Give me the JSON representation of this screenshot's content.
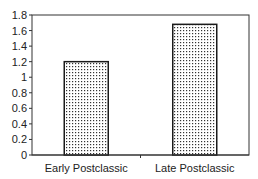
{
  "chart_data": {
    "type": "bar",
    "title": "",
    "xlabel": "",
    "ylabel": "",
    "categories": [
      "Early Postclassic",
      "Late Postclassic"
    ],
    "values": [
      1.2,
      1.68
    ],
    "ylim": [
      0,
      1.8
    ],
    "yticks": [
      "0",
      "0.2",
      "0.4",
      "0.6",
      "0.8",
      "1",
      "1.2",
      "1.4",
      "1.6",
      "1.8"
    ],
    "grid": false,
    "legend": null,
    "bar_fill": "dotted pattern",
    "bar_stroke": "#1a1a1a"
  }
}
